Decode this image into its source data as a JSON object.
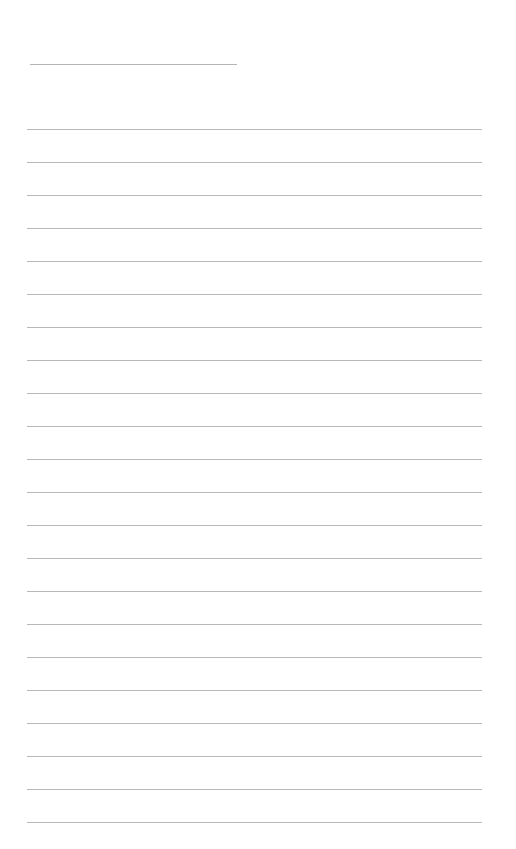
{
  "document": {
    "type": "lined-writing-page",
    "title_line": {
      "present": true,
      "filled_text": ""
    },
    "ruled_lines": {
      "count": 22,
      "first_y": 129,
      "spacing": 33,
      "color": "#b8b8b8",
      "entries": [
        "",
        "",
        "",
        "",
        "",
        "",
        "",
        "",
        "",
        "",
        "",
        "",
        "",
        "",
        "",
        "",
        "",
        "",
        "",
        "",
        "",
        ""
      ]
    },
    "background_color": "#ffffff"
  }
}
